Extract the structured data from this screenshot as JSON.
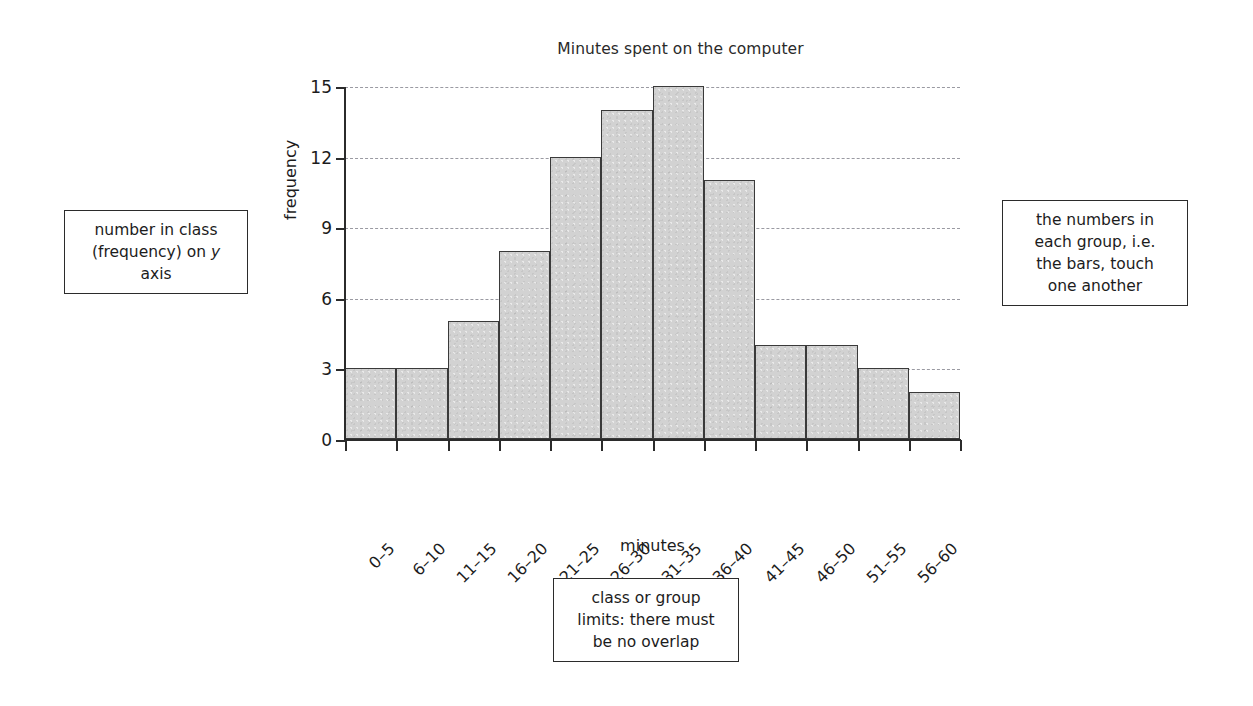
{
  "chart_data": {
    "type": "bar",
    "title": "Minutes spent on the computer",
    "xlabel": "minutes",
    "ylabel": "frequency",
    "categories": [
      "0–5",
      "6–10",
      "11–15",
      "16–20",
      "21–25",
      "26–30",
      "31–35",
      "36–40",
      "41–45",
      "46–50",
      "51–55",
      "56–60"
    ],
    "values": [
      3,
      3,
      5,
      8,
      12,
      14,
      15,
      11,
      4,
      4,
      3,
      2
    ],
    "ylim": [
      0,
      15
    ],
    "yticks": [
      0,
      3,
      6,
      9,
      12,
      15
    ],
    "ytick_labels": [
      "0",
      "3",
      "6",
      "9",
      "12",
      "15"
    ],
    "grid": true,
    "grid_axis": "y",
    "legend": "none",
    "bar_fill_color": "#d2d2d2",
    "bar_edge_color": "#3a3a3a",
    "grid_color": "#9a9aa2",
    "axis_color": "#2b2b2b",
    "background_color": "#ffffff",
    "bar_gap": 0
  },
  "annotations": {
    "left": {
      "line1": "number in class",
      "line2_pre": "(frequency) on ",
      "line2_italic": "y",
      "line3": "axis"
    },
    "right": {
      "line1": "the numbers in",
      "line2": "each group, i.e.",
      "line3": "the bars, touch",
      "line4": "one another"
    },
    "bottom": {
      "line1": "class or group",
      "line2": "limits: there must",
      "line3": "be no overlap"
    }
  }
}
